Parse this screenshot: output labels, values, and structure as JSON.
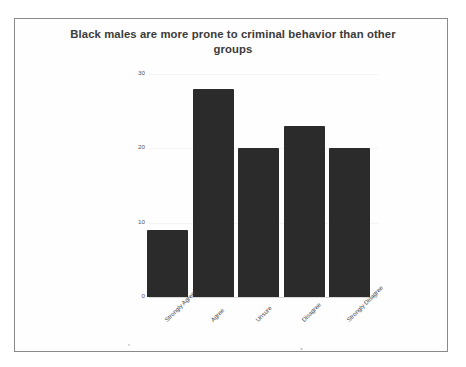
{
  "chart_data": {
    "type": "bar",
    "title": "Black males are more prone to criminal behavior than other groups",
    "categories": [
      "Strongly Agree",
      "Agree",
      "Unsure",
      "Disagree",
      "Strongly Disagree"
    ],
    "values": [
      9,
      28,
      20,
      23,
      20
    ],
    "xlabel": "",
    "ylabel": "",
    "ylim": [
      0,
      30
    ],
    "yticks": [
      0,
      10,
      20,
      30
    ],
    "ytick_labels": [
      "0",
      "10",
      "20",
      "30"
    ],
    "grid": true,
    "legend": null,
    "bar_color": "#2b2b2b",
    "gridline_color": "#f4f4f4",
    "axis_color": "#d8d8d8",
    "title_color": "#3b3b3b",
    "tick_label_color": "#555555",
    "category_label_color": "#4a4a4a",
    "background_color": "#ffffff",
    "frame_border_color": "#8a8a8a",
    "category_label_rotation": -45
  }
}
